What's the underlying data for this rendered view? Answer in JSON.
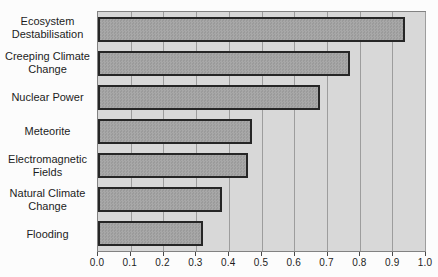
{
  "chart_data": {
    "type": "bar",
    "orientation": "horizontal",
    "title": "",
    "categories": [
      "Ecosystem Destabilisation",
      "Creeping Climate Change",
      "Nuclear Power",
      "Meteorite",
      "Electromagnetic Fields",
      "Natural Climate Change",
      "Flooding"
    ],
    "values": [
      0.94,
      0.77,
      0.68,
      0.47,
      0.46,
      0.38,
      0.32
    ],
    "xlabel": "",
    "ylabel": "",
    "xlim": [
      0,
      1.0
    ],
    "x_ticks": [
      0,
      0.1,
      0.2,
      0.3,
      0.4,
      0.5,
      0.6,
      0.7,
      0.8,
      0.9,
      1.0
    ],
    "x_tick_labels": [
      "0.0",
      "0.1",
      "0.2",
      "0.3",
      "0.4",
      "0.5",
      "0.6",
      "0.7",
      "0.8",
      "0.9",
      "1.0"
    ],
    "grid": "vertical-gridlines-on",
    "legend": "none"
  },
  "colors": {
    "page_bg": "#fcfcfc",
    "plot_bg": "#d8d8d8",
    "gridline": "#9d9d9d",
    "frame": "#828282",
    "bar_fill": "#9b9b9b",
    "bar_fill_alt": "#a8a8a8",
    "bar_border": "#262626",
    "tick": "#4a4a4a",
    "text": "#1c1c1c"
  }
}
